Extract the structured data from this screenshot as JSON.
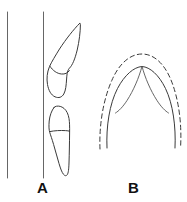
{
  "figure": {
    "background_color": "#ffffff",
    "line_color": "#3a3a3a",
    "label_color": "#111111",
    "caption_labels": {
      "panel_a": "A",
      "panel_b": "B"
    },
    "panels": [
      {
        "id": "panel-a",
        "label": "A",
        "description": "Lateral line drawing of two teeth in profile positioned alongside two vertical reference lines",
        "elements": [
          {
            "name": "reference-line-left",
            "type": "vertical-line",
            "x": 7,
            "y_start": 12,
            "y_end": 178
          },
          {
            "name": "reference-line-right",
            "type": "vertical-line",
            "x": 43,
            "y_start": 12,
            "y_end": 178
          },
          {
            "name": "upper-tooth-outline",
            "type": "closed-outline",
            "description": "Elongated pointed crown angled up and to the right with bulbous root base"
          },
          {
            "name": "upper-tooth-cervical-line",
            "type": "curve",
            "description": "Concave line dividing crown from root"
          },
          {
            "name": "lower-tooth-outline",
            "type": "closed-outline",
            "description": "Shorter tooth with rounded crown and tapering root directed downward"
          },
          {
            "name": "lower-tooth-cervical-line",
            "type": "curve",
            "description": "Horizontal line dividing crown from root"
          }
        ]
      },
      {
        "id": "panel-b",
        "label": "B",
        "description": "Occlusal dental arch diagram with dashed outer arch, solid inner arch, and paired median V-curves",
        "elements": [
          {
            "name": "outer-arch-dashed",
            "type": "dashed-arch",
            "description": "Broad parabolic dashed outline of outer arch"
          },
          {
            "name": "inner-arch-solid",
            "type": "solid-arch",
            "description": "Narrower solid parabolic arch nested inside the dashed arch"
          },
          {
            "name": "median-v-curve-left",
            "type": "curve",
            "description": "Curve descending from arch apex toward lower left"
          },
          {
            "name": "median-v-curve-right",
            "type": "curve",
            "description": "Curve descending from arch apex toward lower right"
          },
          {
            "name": "arch-apex-point",
            "type": "vertex",
            "description": "Midline convergence point at top of arch"
          }
        ]
      }
    ]
  }
}
